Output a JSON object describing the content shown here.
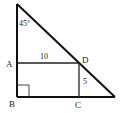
{
  "diagram": {
    "type": "geometry-figure",
    "angle_label": "45°",
    "points": {
      "A": "A",
      "B": "B",
      "C": "C",
      "D": "D"
    },
    "measurements": {
      "AD": "10",
      "DC": "5"
    },
    "right_angle_at": "B",
    "colors": {
      "line": "#111111",
      "background": "#ffffff"
    }
  }
}
